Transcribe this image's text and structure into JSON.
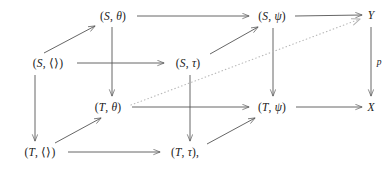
{
  "diagram": {
    "kind": "commutative-cube",
    "nodes": [
      {
        "id": "s-empty",
        "label": "(S, ⟨⟩)",
        "x": 48,
        "y": 63
      },
      {
        "id": "s-theta",
        "label": "(S, θ)",
        "x": 113,
        "y": 16
      },
      {
        "id": "s-tau",
        "label": "(S, τ)",
        "x": 188,
        "y": 63
      },
      {
        "id": "s-psi",
        "label": "(S, ψ)",
        "x": 272,
        "y": 16
      },
      {
        "id": "t-empty",
        "label": "(T, ⟨⟩)",
        "x": 40,
        "y": 152
      },
      {
        "id": "t-theta",
        "label": "(T, θ)",
        "x": 108,
        "y": 107
      },
      {
        "id": "t-tau",
        "label": "(T, τ),",
        "x": 185,
        "y": 152
      },
      {
        "id": "t-psi",
        "label": "(T, ψ)",
        "x": 272,
        "y": 107
      },
      {
        "id": "y-node",
        "label": "Y",
        "x": 371,
        "y": 15
      },
      {
        "id": "x-node",
        "label": "X",
        "x": 371,
        "y": 107
      }
    ],
    "edge_labels": [
      {
        "id": "p-label",
        "label": "p",
        "x": 379,
        "y": 62
      }
    ],
    "edges": [
      {
        "from": "s-theta",
        "to": "s-psi",
        "style": "solid",
        "dir": "right"
      },
      {
        "from": "s-psi",
        "to": "y-node",
        "style": "solid",
        "dir": "right"
      },
      {
        "from": "s-empty",
        "to": "s-theta",
        "style": "solid",
        "dir": "diagonal-up"
      },
      {
        "from": "s-empty",
        "to": "s-tau",
        "style": "solid",
        "dir": "right"
      },
      {
        "from": "s-tau",
        "to": "s-psi",
        "style": "solid",
        "dir": "diagonal-up"
      },
      {
        "from": "s-theta",
        "to": "t-theta",
        "style": "solid",
        "dir": "down"
      },
      {
        "from": "s-empty",
        "to": "t-empty",
        "style": "solid",
        "dir": "down"
      },
      {
        "from": "s-tau",
        "to": "t-tau",
        "style": "solid",
        "dir": "down"
      },
      {
        "from": "s-psi",
        "to": "t-psi",
        "style": "solid",
        "dir": "down"
      },
      {
        "from": "t-theta",
        "to": "t-psi",
        "style": "solid",
        "dir": "right"
      },
      {
        "from": "t-psi",
        "to": "x-node",
        "style": "solid",
        "dir": "right"
      },
      {
        "from": "t-empty",
        "to": "t-theta",
        "style": "solid",
        "dir": "diagonal-up"
      },
      {
        "from": "t-empty",
        "to": "t-tau",
        "style": "solid",
        "dir": "right"
      },
      {
        "from": "t-tau",
        "to": "t-psi",
        "style": "solid",
        "dir": "diagonal-up"
      },
      {
        "from": "y-node",
        "to": "x-node",
        "style": "solid",
        "dir": "down",
        "label": "p"
      },
      {
        "from": "t-theta",
        "to": "y-node",
        "style": "dotted",
        "dir": "diagonal-up"
      }
    ]
  },
  "colors": {
    "ink": "#1a1a1a",
    "line": "#555555",
    "dotted": "#b9b9b9",
    "background": "#ffffff"
  }
}
